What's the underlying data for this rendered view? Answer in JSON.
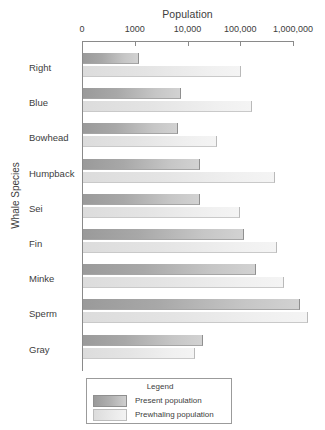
{
  "chart_data": {
    "type": "bar",
    "orientation": "horizontal",
    "title": "Population",
    "xlabel": "Population",
    "ylabel": "Whale Species",
    "xscale": "log",
    "xticks": [
      "0",
      "1000",
      "10,000",
      "100,000",
      "1,000,000"
    ],
    "xtick_values": [
      100,
      1000,
      10000,
      100000,
      1000000
    ],
    "xlim": [
      100,
      1600000
    ],
    "grid": false,
    "legend_position": "bottom-center",
    "legend_title": "Legend",
    "categories": [
      "Right",
      "Blue",
      "Bowhead",
      "Humpback",
      "Sei",
      "Fin",
      "Minke",
      "Sperm",
      "Gray"
    ],
    "series": [
      {
        "name": "Present population",
        "color": "#a8a8a8",
        "values": [
          1200,
          7500,
          6500,
          17000,
          17000,
          120000,
          200000,
          1350000,
          20000
        ]
      },
      {
        "name": "Prewhaling population",
        "color": "#e8e8e8",
        "values": [
          105000,
          170000,
          37000,
          460000,
          100000,
          500000,
          680000,
          1900000,
          14000
        ]
      }
    ]
  },
  "axis": {
    "title": "Population",
    "y_title": "Whale Species"
  },
  "legend": {
    "title": "Legend",
    "entries": [
      {
        "label": "Present population",
        "swatch": "present-swatch"
      },
      {
        "label": "Prewhaling population",
        "swatch": "prewhaling-swatch"
      }
    ]
  }
}
